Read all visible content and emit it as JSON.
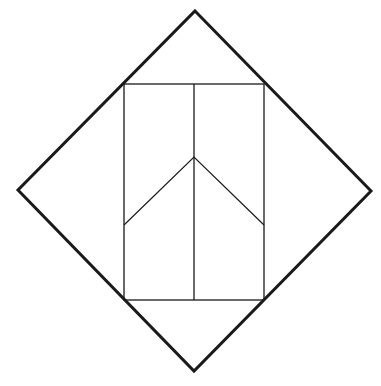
{
  "diagram": {
    "canvas": {
      "width": 381,
      "height": 386,
      "background": "#ffffff"
    },
    "stroke_color": "#1a1a1a",
    "outer_diamond": {
      "points": [
        [
          195,
          11
        ],
        [
          371,
          191
        ],
        [
          194,
          371
        ],
        [
          18,
          190
        ]
      ],
      "stroke_width": 3
    },
    "inner_rectangle": {
      "x": 124,
      "y": 84,
      "width": 140,
      "height": 216,
      "stroke_width": 1.3
    },
    "center_line": {
      "x1": 194,
      "y1": 84,
      "x2": 194,
      "y2": 300,
      "stroke_width": 1.3
    },
    "chevron": {
      "points": [
        [
          124,
          225
        ],
        [
          194,
          157
        ],
        [
          264,
          225
        ]
      ],
      "stroke_width": 1.2
    }
  }
}
